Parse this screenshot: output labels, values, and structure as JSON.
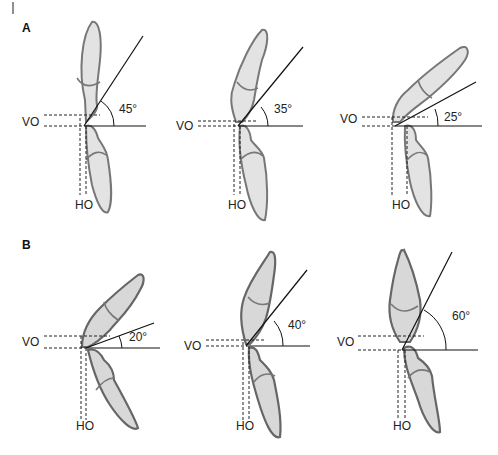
{
  "figure": {
    "corner_mark": "|",
    "panels": [
      {
        "label": "A",
        "diagrams": [
          {
            "angle_label": "45°",
            "vo_label": "VO",
            "ho_label": "HO"
          },
          {
            "angle_label": "35°",
            "vo_label": "VO",
            "ho_label": "HO"
          },
          {
            "angle_label": "25°",
            "vo_label": "VO",
            "ho_label": "HO"
          }
        ]
      },
      {
        "label": "B",
        "diagrams": [
          {
            "angle_label": "20°",
            "vo_label": "VO",
            "ho_label": "HO"
          },
          {
            "angle_label": "40°",
            "vo_label": "VO",
            "ho_label": "HO"
          },
          {
            "angle_label": "60°",
            "vo_label": "VO",
            "ho_label": "HO"
          }
        ]
      }
    ]
  }
}
